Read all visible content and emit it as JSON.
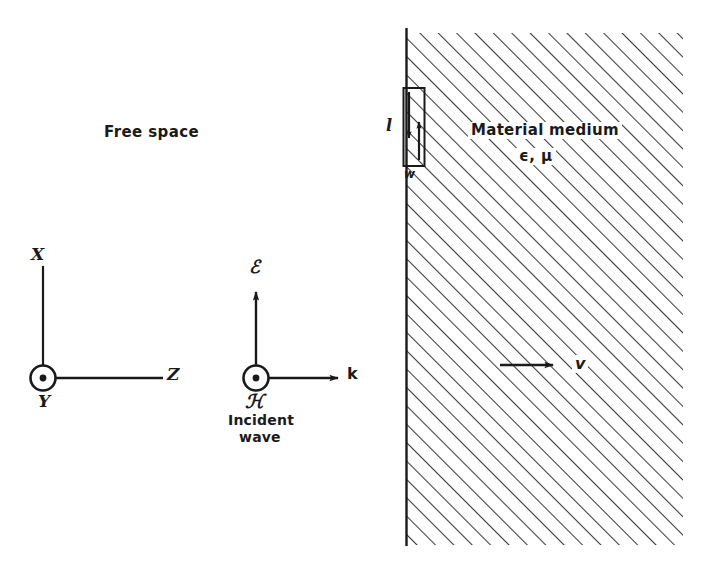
{
  "figure": {
    "title_fragment": "",
    "regions": {
      "left": {
        "label": "Free space"
      },
      "right": {
        "label": "Material medium",
        "constitutive_params": "ϵ, μ"
      }
    },
    "coordinate_axes": {
      "vertical_label": "X",
      "out_of_page_label": "Y",
      "horizontal_label": "Z"
    },
    "wave_triad": {
      "electric_field_label": "ℰ",
      "magnetic_field_label": "ℋ",
      "propagation_label": "k",
      "caption_line1": "Incident",
      "caption_line2": "wave"
    },
    "loop": {
      "length_label": "l",
      "width_label": "w"
    },
    "velocity": {
      "label": "v"
    },
    "colors": {
      "ink": "#1a1a1a",
      "hatch": "#3a3a3a",
      "background": "#ffffff"
    }
  }
}
